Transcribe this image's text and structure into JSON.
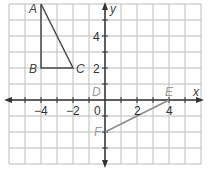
{
  "diagram": {
    "axes": {
      "x_label": "x",
      "y_label": "y",
      "x_range": [
        -6,
        6
      ],
      "y_range": [
        -4,
        6
      ],
      "x_ticks": [
        {
          "value": -4,
          "label": "−4"
        },
        {
          "value": -2,
          "label": "−2"
        },
        {
          "value": 0,
          "label": "0"
        },
        {
          "value": 2,
          "label": "2"
        },
        {
          "value": 4,
          "label": "4"
        }
      ],
      "y_ticks": [
        {
          "value": 2,
          "label": "2"
        },
        {
          "value": 4,
          "label": "4"
        }
      ]
    },
    "points": [
      {
        "name": "A",
        "x": -4,
        "y": 6
      },
      {
        "name": "B",
        "x": -4,
        "y": 2
      },
      {
        "name": "C",
        "x": -2,
        "y": 2
      },
      {
        "name": "D",
        "x": 0,
        "y": 0
      },
      {
        "name": "E",
        "x": 4,
        "y": 0
      },
      {
        "name": "F",
        "x": 0,
        "y": -2
      }
    ],
    "shapes": [
      {
        "type": "triangle",
        "vertices": [
          "A",
          "B",
          "C"
        ],
        "color": "#4a4a4a"
      },
      {
        "type": "segment",
        "vertices": [
          "F",
          "E"
        ],
        "color": "#8a8a8a"
      }
    ],
    "colors": {
      "grid": "#b8b8b8",
      "axis": "#333333",
      "triangle": "#4a4a4a",
      "segment": "#8a8a8a"
    }
  }
}
